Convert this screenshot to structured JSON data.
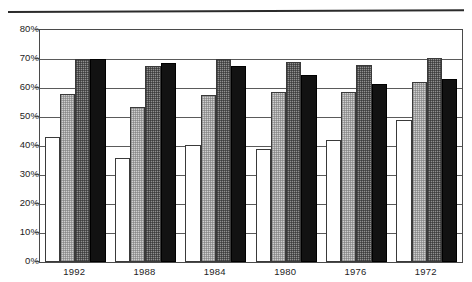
{
  "chart_data": {
    "type": "bar",
    "title": "",
    "subtitle": "",
    "xlabel": "",
    "ylabel": "",
    "ylim": [
      0,
      80
    ],
    "yticks": [
      "0%",
      "10%",
      "20%",
      "30%",
      "40%",
      "50%",
      "60%",
      "70%",
      "80%"
    ],
    "ytick_values": [
      0,
      10,
      20,
      30,
      40,
      50,
      60,
      70,
      80
    ],
    "grid": true,
    "legend": "none",
    "categories": [
      "1992",
      "1988",
      "1984",
      "1980",
      "1976",
      "1972"
    ],
    "series": [
      {
        "name": "series-1",
        "fill": "white",
        "values": [
          43.0,
          36.0,
          40.5,
          39.0,
          42.0,
          49.0
        ]
      },
      {
        "name": "series-2",
        "fill": "light-gray",
        "values": [
          58.0,
          53.5,
          57.5,
          58.5,
          58.5,
          62.0
        ]
      },
      {
        "name": "series-3",
        "fill": "medium-gray",
        "values": [
          70.0,
          67.5,
          70.0,
          69.0,
          68.0,
          70.5
        ]
      },
      {
        "name": "series-4",
        "fill": "black",
        "values": [
          70.0,
          68.5,
          67.5,
          64.5,
          61.5,
          63.0
        ]
      }
    ],
    "colors": {
      "series_1": "#ffffff",
      "series_2": "#cfcfcf",
      "series_3": "#8f8f8f",
      "series_4": "#121212",
      "axis": "#4a4a4a",
      "grid": "#5a5a5a",
      "text": "#1d1d1d",
      "background": "#ffffff"
    }
  }
}
